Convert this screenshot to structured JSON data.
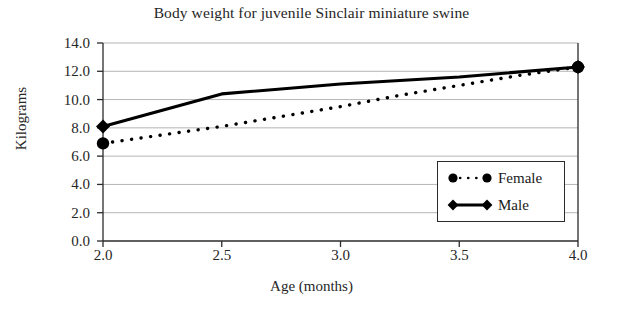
{
  "chart_data": {
    "type": "line",
    "title": "Body weight for juvenile Sinclair miniature swine",
    "xlabel": "Age (months)",
    "ylabel": "Kilograms",
    "xlim": [
      2.0,
      4.0
    ],
    "ylim": [
      0.0,
      14.0
    ],
    "xticks": [
      "2.0",
      "2.5",
      "3.0",
      "3.5",
      "4.0"
    ],
    "xtick_values": [
      2.0,
      2.5,
      3.0,
      3.5,
      4.0
    ],
    "yticks": [
      "0.0",
      "2.0",
      "4.0",
      "6.0",
      "8.0",
      "10.0",
      "12.0",
      "14.0"
    ],
    "ytick_values": [
      0.0,
      2.0,
      4.0,
      6.0,
      8.0,
      10.0,
      12.0,
      14.0
    ],
    "grid": "horizontal",
    "legend_position": "lower-right-inside",
    "series": [
      {
        "name": "Female",
        "marker": "circle",
        "linestyle": "dotted",
        "color": "#000000",
        "x": [
          2.0,
          2.25,
          2.5,
          2.75,
          3.0,
          3.25,
          3.5,
          3.75,
          4.0
        ],
        "values": [
          6.9,
          7.5,
          8.1,
          8.8,
          9.5,
          10.3,
          11.0,
          11.7,
          12.3
        ]
      },
      {
        "name": "Male",
        "marker": "diamond",
        "linestyle": "solid",
        "color": "#000000",
        "x": [
          2.0,
          2.5,
          3.0,
          3.5,
          4.0
        ],
        "values": [
          8.1,
          10.4,
          11.1,
          11.6,
          12.3
        ]
      }
    ],
    "colors": {
      "axis": "#2b2b2b",
      "grid": "#b5b5b5",
      "text": "#262626",
      "background": "#ffffff"
    }
  },
  "legend": {
    "entries": [
      {
        "label": "Female"
      },
      {
        "label": "Male"
      }
    ]
  }
}
